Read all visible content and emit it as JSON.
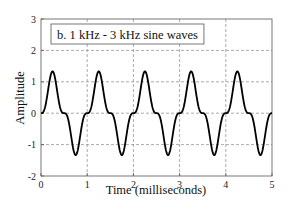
{
  "chart_data": {
    "type": "line",
    "title": "b.  1 kHz - 3 kHz sine waves",
    "xlabel": "Time (milliseconds)",
    "ylabel": "Amplitude",
    "xlim": [
      0,
      5
    ],
    "ylim": [
      -2,
      3
    ],
    "xticks": [
      0,
      1,
      2,
      3,
      4,
      5
    ],
    "yticks": [
      -2,
      -1,
      0,
      1,
      2,
      3
    ],
    "grid": true,
    "grid_style": "dashed",
    "legend_position": "upper-left (inside plot, boxed)",
    "series": [
      {
        "name": "1 kHz - 3 kHz sine waves",
        "formula": "sin(2*pi*1*t) - (1/3)*sin(2*pi*3*t), t in ms",
        "color": "#000000",
        "approx_points": [
          {
            "x": 0.0,
            "y": 0.0
          },
          {
            "x": 0.1,
            "y": 0.27
          },
          {
            "x": 0.25,
            "y": 1.33
          },
          {
            "x": 0.4,
            "y": 0.27
          },
          {
            "x": 0.5,
            "y": 0.0
          },
          {
            "x": 0.6,
            "y": -0.27
          },
          {
            "x": 0.75,
            "y": -1.33
          },
          {
            "x": 0.9,
            "y": -0.27
          },
          {
            "x": 1.0,
            "y": 0.0
          }
        ],
        "peak": 1.33,
        "trough": -1.33,
        "period_ms": 1.0,
        "cycles_shown": 5
      }
    ]
  },
  "colors": {
    "line": "#000000",
    "frame": "#555555",
    "grid": "#888888",
    "background": "#ffffff"
  }
}
